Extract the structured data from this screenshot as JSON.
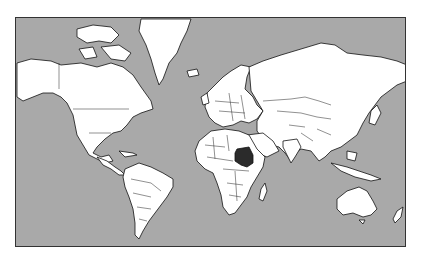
{
  "map": {
    "title": "",
    "projection": "Mercator world map",
    "ocean_color": "#a9a9a9",
    "land_color": "#ffffff",
    "highlight_color": "#2b2b2b",
    "highlighted_country": "Sudan"
  }
}
